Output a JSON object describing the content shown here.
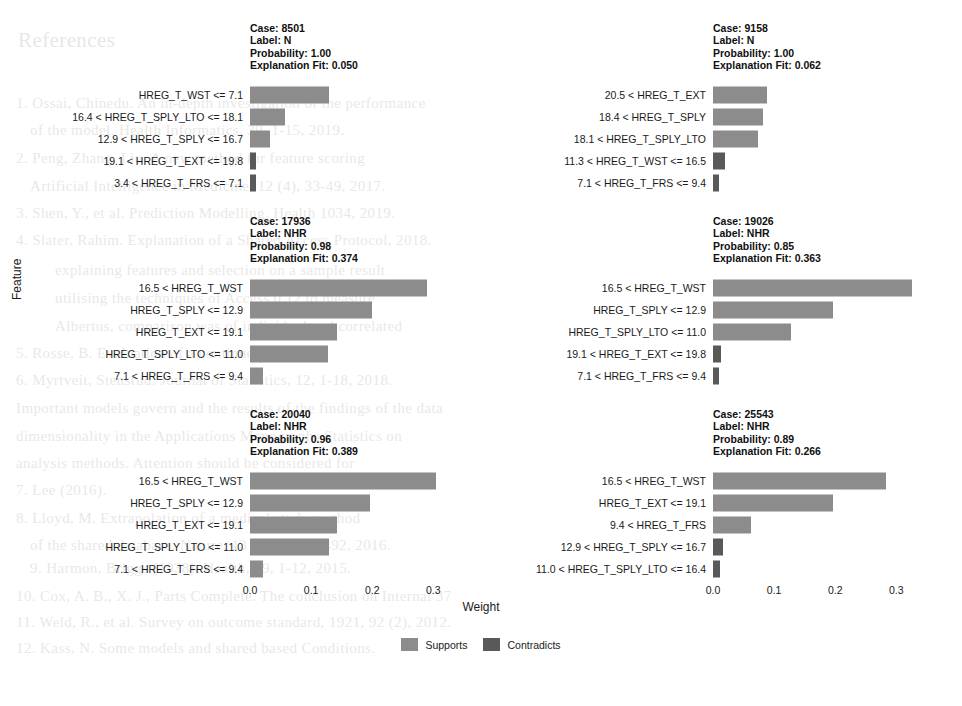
{
  "figure": {
    "xlabel": "Weight",
    "ylabel": "Feature",
    "xticks": [
      "0.0",
      "0.1",
      "0.2",
      "0.3"
    ],
    "xtick_values": [
      0.0,
      0.1,
      0.2,
      0.3
    ],
    "legend": {
      "supports_label": "Supports",
      "contradicts_label": "Contradicts",
      "supports_color": "#8c8c8c",
      "contradicts_color": "#595959"
    }
  },
  "chart_data": {
    "type": "bar",
    "title": "",
    "xlabel": "Weight",
    "ylabel": "Feature",
    "xlim": [
      0.0,
      0.36
    ],
    "xticks": [
      0.0,
      0.1,
      0.2,
      0.3
    ],
    "grid": false,
    "legend_position": "bottom-center",
    "series_colors": {
      "Supports": "#8c8c8c",
      "Contradicts": "#595959"
    },
    "orientation": "horizontal",
    "panels": [
      {
        "case": "8501",
        "label": "N",
        "probability": "1.00",
        "explanation_fit": "0.050",
        "header_lines": [
          "Case: 8501",
          "Label: N",
          "Probability: 1.00",
          "Explanation Fit: 0.050"
        ],
        "categories": [
          "HREG_T_WST <= 7.1",
          "16.4 < HREG_T_SPLY_LTO <= 18.1",
          "12.9 < HREG_T_SPLY <= 16.7",
          "19.1 < HREG_T_EXT <= 19.8",
          "3.4 < HREG_T_FRS <= 7.1"
        ],
        "values": [
          0.129,
          0.057,
          0.032,
          0.01,
          0.009
        ],
        "kinds": [
          "Supports",
          "Supports",
          "Supports",
          "Contradicts",
          "Contradicts"
        ]
      },
      {
        "case": "9158",
        "label": "N",
        "probability": "1.00",
        "explanation_fit": "0.062",
        "header_lines": [
          "Case: 9158",
          "Label: N",
          "Probability: 1.00",
          "Explanation Fit: 0.062"
        ],
        "categories": [
          "20.5 < HREG_T_EXT",
          "18.4 < HREG_T_SPLY",
          "18.1 < HREG_T_SPLY_LTO",
          "11.3 < HREG_T_WST <= 16.5",
          "7.1 < HREG_T_FRS <= 9.4"
        ],
        "values": [
          0.088,
          0.081,
          0.073,
          0.02,
          0.009
        ],
        "kinds": [
          "Supports",
          "Supports",
          "Supports",
          "Contradicts",
          "Contradicts"
        ]
      },
      {
        "case": "17936",
        "label": "NHR",
        "probability": "0.98",
        "explanation_fit": "0.374",
        "header_lines": [
          "Case: 17936",
          "Label: NHR",
          "Probability: 0.98",
          "Explanation Fit: 0.374"
        ],
        "categories": [
          "16.5 < HREG_T_WST",
          "HREG_T_SPLY <= 12.9",
          "HREG_T_EXT <= 19.1",
          "HREG_T_SPLY_LTO <= 11.0",
          "7.1 < HREG_T_FRS <= 9.4"
        ],
        "values": [
          0.289,
          0.2,
          0.143,
          0.128,
          0.022
        ],
        "kinds": [
          "Supports",
          "Supports",
          "Supports",
          "Supports",
          "Supports"
        ]
      },
      {
        "case": "19026",
        "label": "NHR",
        "probability": "0.85",
        "explanation_fit": "0.363",
        "header_lines": [
          "Case: 19026",
          "Label: NHR",
          "Probability: 0.85",
          "Explanation Fit: 0.363"
        ],
        "categories": [
          "16.5 < HREG_T_WST",
          "HREG_T_SPLY <= 12.9",
          "HREG_T_SPLY_LTO <= 11.0",
          "19.1 < HREG_T_EXT <= 19.8",
          "7.1 < HREG_T_FRS <= 9.4"
        ],
        "values": [
          0.325,
          0.196,
          0.128,
          0.013,
          0.009
        ],
        "kinds": [
          "Supports",
          "Supports",
          "Supports",
          "Contradicts",
          "Contradicts"
        ]
      },
      {
        "case": "20040",
        "label": "NHR",
        "probability": "0.96",
        "explanation_fit": "0.389",
        "header_lines": [
          "Case: 20040",
          "Label: NHR",
          "Probability: 0.96",
          "Explanation Fit: 0.389"
        ],
        "categories": [
          "16.5 < HREG_T_WST",
          "HREG_T_SPLY <= 12.9",
          "HREG_T_EXT <= 19.1",
          "HREG_T_SPLY_LTO <= 11.0",
          "7.1 < HREG_T_FRS <= 9.4"
        ],
        "values": [
          0.305,
          0.196,
          0.142,
          0.13,
          0.021
        ],
        "kinds": [
          "Supports",
          "Supports",
          "Supports",
          "Supports",
          "Supports"
        ]
      },
      {
        "case": "25543",
        "label": "NHR",
        "probability": "0.89",
        "explanation_fit": "0.266",
        "header_lines": [
          "Case: 25543",
          "Label: NHR",
          "Probability: 0.89",
          "Explanation Fit: 0.266"
        ],
        "categories": [
          "16.5 < HREG_T_WST",
          "HREG_T_EXT <= 19.1",
          "9.4 < HREG_T_FRS",
          "12.9 < HREG_T_SPLY <= 16.7",
          "11.0 < HREG_T_SPLY_LTO <= 16.4"
        ],
        "values": [
          0.283,
          0.196,
          0.062,
          0.017,
          0.011
        ],
        "kinds": [
          "Supports",
          "Supports",
          "Supports",
          "Contradicts",
          "Contradicts"
        ]
      }
    ]
  },
  "ghost_text": [
    {
      "t": "References",
      "x": 18,
      "y": 28,
      "s": 21
    },
    {
      "t": "1. Ossai, Chinedu. An in-depth investigation of the performance",
      "x": 16,
      "y": 95,
      "s": 15
    },
    {
      "t": "of the model. Health Informatics, 39, 1-15, 2019.",
      "x": 30,
      "y": 122,
      "s": 15
    },
    {
      "t": "2. Peng, Zhang, Liu. A new method for feature scoring",
      "x": 16,
      "y": 150,
      "s": 15
    },
    {
      "t": "Artificial Intelligence in Medicine, 12 (4), 33-49, 2017.",
      "x": 30,
      "y": 178,
      "s": 15
    },
    {
      "t": "3. Shen, Y., et al. Prediction Modelling. Health 1034, 2019.",
      "x": 16,
      "y": 205,
      "s": 15
    },
    {
      "t": "4. Slater, Rahim. Explanation of a Shared Access Protocol, 2018.",
      "x": 16,
      "y": 232,
      "s": 15
    },
    {
      "t": "explaining features and selection on a sample result",
      "x": 55,
      "y": 262,
      "s": 15
    },
    {
      "t": "utilising the techniques of Access 0.12 to measure",
      "x": 55,
      "y": 290,
      "s": 15
    },
    {
      "t": "Albertus, comparison was of individual and correlated",
      "x": 55,
      "y": 318,
      "s": 15
    },
    {
      "t": "5. Rosse, B. Evaluation of a continued utility",
      "x": 16,
      "y": 345,
      "s": 15
    },
    {
      "t": "6. Myrtveit, Stensrud. Journal of Statistics, 12, 1-18, 2018.",
      "x": 16,
      "y": 372,
      "s": 15
    },
    {
      "t": "Important models govern and the results of the findings of the data",
      "x": 16,
      "y": 400,
      "s": 15
    },
    {
      "t": "dimensionality in the Applications Monographs Statistics on",
      "x": 16,
      "y": 428,
      "s": 15
    },
    {
      "t": "analysis methods. Attention should be considered for",
      "x": 16,
      "y": 455,
      "s": 15
    },
    {
      "t": "7. Lee (2016).",
      "x": 16,
      "y": 482,
      "s": 15
    },
    {
      "t": "8. Lloyd, M. Extrapolation of a medical study method",
      "x": 16,
      "y": 510,
      "s": 15
    },
    {
      "t": "of the shared database. Nature, 13 (4), 1437-1492, 2016.",
      "x": 30,
      "y": 537,
      "s": 15
    },
    {
      "t": "9. Harmon, Briggs (1938). Health, 19, 1-12, 2015.",
      "x": 30,
      "y": 560,
      "s": 15
    },
    {
      "t": "10. Cox, A. B., X. J., Parts Complete. The conclusion on Internal 37",
      "x": 16,
      "y": 588,
      "s": 15
    },
    {
      "t": "11. Weld, R., et al. Survey on outcome standard, 1921, 92 (2), 2012.",
      "x": 16,
      "y": 614,
      "s": 15
    },
    {
      "t": "12. Kass, N. Some models and shared based Conditions.",
      "x": 16,
      "y": 640,
      "s": 15
    }
  ]
}
